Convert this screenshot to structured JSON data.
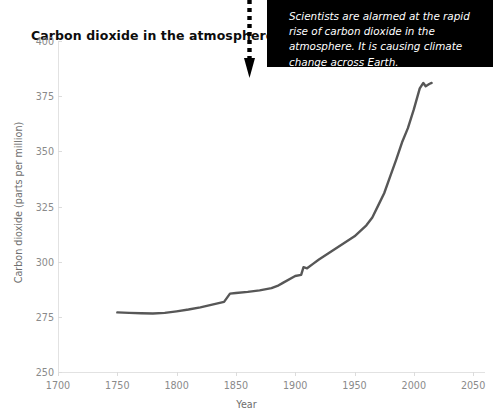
{
  "chart_data": {
    "type": "line",
    "title": "Carbon dioxide in the atmosphere",
    "xlabel": "Year",
    "ylabel": "Carbon dioxide (parts per million)",
    "xlim": [
      1700,
      2060
    ],
    "ylim": [
      250,
      400
    ],
    "xticks": [
      1700,
      1750,
      1800,
      1850,
      1900,
      1950,
      2000,
      2050
    ],
    "xtick_labels": [
      "1700",
      "1750",
      "1800",
      "1850",
      "1900",
      "1950",
      "2000",
      "2050"
    ],
    "yticks": [
      250,
      275,
      300,
      325,
      350,
      375,
      400
    ],
    "ytick_labels": [
      "250",
      "275",
      "300",
      "325",
      "350",
      "375",
      "400"
    ],
    "grid": false,
    "legend": "none",
    "line_color": "#575757",
    "series": [
      {
        "name": "Atmospheric CO2",
        "x": [
          1750,
          1760,
          1770,
          1780,
          1790,
          1800,
          1810,
          1820,
          1830,
          1840,
          1845,
          1850,
          1860,
          1870,
          1880,
          1885,
          1890,
          1900,
          1905,
          1907,
          1910,
          1915,
          1920,
          1930,
          1940,
          1950,
          1955,
          1960,
          1965,
          1970,
          1975,
          1980,
          1985,
          1990,
          1995,
          2000,
          2005,
          2008,
          2010,
          2013,
          2015
        ],
        "y": [
          277.0,
          276.8,
          276.6,
          276.5,
          276.8,
          277.5,
          278.3,
          279.3,
          280.5,
          281.8,
          285.5,
          285.8,
          286.3,
          287.0,
          288.0,
          289.0,
          290.5,
          293.5,
          294.0,
          297.5,
          297.0,
          299.0,
          301.0,
          304.5,
          308.0,
          311.5,
          314.0,
          316.5,
          320.0,
          325.5,
          331.0,
          338.5,
          346.0,
          354.0,
          360.5,
          369.0,
          378.5,
          381.0,
          379.5,
          380.5,
          381.0
        ]
      }
    ]
  },
  "callout": {
    "text": "Scientists are alarmed at the rapid rise of carbon dioxide in the atmosphere. It is causing climate change across Earth."
  }
}
